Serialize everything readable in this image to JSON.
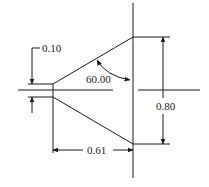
{
  "diagram": {
    "type": "cone nozzle dimension drawing",
    "dimensions": {
      "tip_opening": "0.10",
      "angle": "60.00",
      "base_diameter": "0.80",
      "length": "0.61"
    }
  }
}
